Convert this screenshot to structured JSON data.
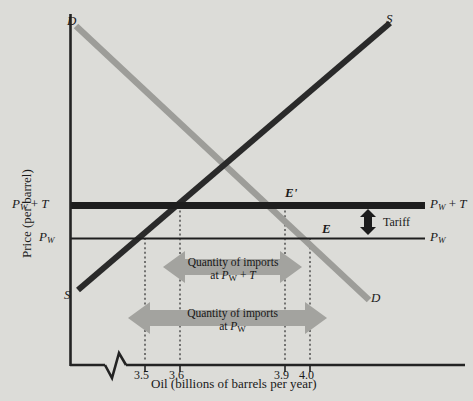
{
  "figure": {
    "background_color": "#dcdcd8",
    "axis_color": "#222222",
    "supply_color": "#262626",
    "demand_color": "#9a9a96",
    "arrow_color": "#a0a09c",
    "tariff_arrow_color": "#1c1c1c"
  },
  "axes": {
    "y_title": "Price (per barrel)",
    "x_title": "Oil (billions of barrels per year)",
    "x_ticks": [
      {
        "label": "3.5",
        "value": 3.5
      },
      {
        "label": "3.6",
        "value": 3.6
      },
      {
        "label": "3.9",
        "value": 3.9
      },
      {
        "label": "4.0",
        "value": 4.0
      }
    ],
    "has_axis_break": true
  },
  "price_lines": {
    "with_tariff": {
      "label_left": "P_W + T",
      "label_right": "P_W + T",
      "label_left_html": "<i>P</i><sub>W</sub> + <i>T</i>",
      "label_right_html": "<i>P</i><sub>W</sub> + <i>T</i>"
    },
    "world": {
      "label_left": "P_W",
      "label_right": "P_W",
      "label_left_html": "<i>P</i><sub>W</sub>",
      "label_right_html": "<i>P</i><sub>W</sub>"
    }
  },
  "curves": {
    "supply": {
      "label": "S",
      "label_top": "S",
      "label_bottom": "S"
    },
    "demand": {
      "label": "D",
      "label_top": "D",
      "label_bottom": "D"
    }
  },
  "equilibria": [
    {
      "name": "E-prime",
      "label": "E'"
    },
    {
      "name": "E",
      "label": "E"
    }
  ],
  "annotations": {
    "tariff": {
      "label": "Tariff"
    },
    "imports_with_tariff": {
      "line1": "Quantity of imports",
      "line2_html": "at <i>P</i><sub>W</sub> + <i>T</i>",
      "line2": "at P_W + T",
      "from": 3.6,
      "to": 3.9
    },
    "imports_world_price": {
      "line1": "Quantity of imports",
      "line2_html": "at <i>P</i><sub>W</sub>",
      "line2": "at P_W",
      "from": 3.5,
      "to": 4.0
    }
  },
  "chart_data": {
    "type": "line",
    "title": "",
    "xlabel": "Oil (billions of barrels per year)",
    "ylabel": "Price (per barrel)",
    "xlim": [
      3.45,
      4.12
    ],
    "x_tick_values": [
      3.5,
      3.6,
      3.9,
      4.0
    ],
    "x_tick_labels": [
      "3.5",
      "3.6",
      "3.9",
      "4.0"
    ],
    "grid": false,
    "legend": "none",
    "series": [
      {
        "name": "S",
        "description": "Domestic supply curve, upward sloping",
        "points": [
          [
            3.455,
            0.1
          ],
          [
            4.1,
            0.94
          ]
        ]
      },
      {
        "name": "D",
        "description": "Domestic demand curve, downward sloping",
        "points": [
          [
            3.452,
            0.95
          ],
          [
            4.06,
            0.075
          ]
        ]
      },
      {
        "name": "P_W + T",
        "description": "World price plus tariff, horizontal line",
        "points": [
          [
            3.45,
            0.435
          ],
          [
            4.14,
            0.435
          ]
        ]
      },
      {
        "name": "P_W",
        "description": "World price, horizontal line",
        "points": [
          [
            3.45,
            0.345
          ],
          [
            4.14,
            0.345
          ]
        ]
      }
    ],
    "annotations": [
      {
        "label": "E'",
        "x": 3.9,
        "y": 0.435
      },
      {
        "label": "E",
        "x": 4.0,
        "y": 0.345
      },
      {
        "label": "Tariff",
        "x": 4.07,
        "y": 0.39
      },
      {
        "label": "Quantity of imports at P_W + T",
        "x_from": 3.6,
        "x_to": 3.9
      },
      {
        "label": "Quantity of imports at P_W",
        "x_from": 3.5,
        "x_to": 4.0
      }
    ],
    "domestic_supply_at_tariff_price": 3.6,
    "domestic_demand_at_tariff_price": 3.9,
    "domestic_supply_at_world_price": 3.5,
    "domestic_demand_at_world_price": 4.0
  }
}
